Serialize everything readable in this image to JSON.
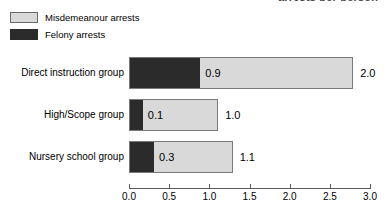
{
  "title_remnant": "arrests per person",
  "legend": {
    "items": [
      {
        "label": "Misdemeanour arrests",
        "color": "#d9d9d9",
        "swatch": "misdemeanour-swatch"
      },
      {
        "label": "Felony arrests",
        "color": "#2b2b2b",
        "swatch": "felony-swatch"
      }
    ]
  },
  "axis": {
    "ticks": [
      "0.0",
      "0.5",
      "1.0",
      "1.5",
      "2.0",
      "2.5",
      "3.0"
    ],
    "min": 0.0,
    "max": 3.0,
    "step": 0.5
  },
  "rows": [
    {
      "label": "Direct instruction group",
      "felony_label": "0.9",
      "total_label": "2.0",
      "felony": 0.875,
      "total": 2.79
    },
    {
      "label": "High/Scope group",
      "felony_label": "0.1",
      "total_label": "1.0",
      "felony": 0.16,
      "total": 1.11
    },
    {
      "label": "Nursery school group",
      "felony_label": "0.3",
      "total_label": "1.1",
      "felony": 0.3,
      "total": 1.29
    }
  ],
  "chart_data": {
    "type": "bar",
    "orientation": "horizontal",
    "stacked": true,
    "title": "",
    "xlabel": "",
    "ylabel": "",
    "xlim": [
      0.0,
      3.0
    ],
    "xticks": [
      0.0,
      0.5,
      1.0,
      1.5,
      2.0,
      2.5,
      3.0
    ],
    "grid": false,
    "legend_position": "top-left",
    "categories": [
      "Direct instruction group",
      "High/Scope group",
      "Nursery school group"
    ],
    "series": [
      {
        "name": "Felony arrests",
        "color": "#2b2b2b",
        "values": [
          0.9,
          0.1,
          0.3
        ]
      },
      {
        "name": "Misdemeanour arrests",
        "color": "#d9d9d9",
        "values": [
          1.9,
          1.0,
          1.0
        ]
      }
    ],
    "totals": [
      2.0,
      1.0,
      1.1
    ],
    "data_labels": {
      "felony": [
        "0.9",
        "0.1",
        "0.3"
      ],
      "total": [
        "2.0",
        "1.0",
        "1.1"
      ]
    }
  }
}
